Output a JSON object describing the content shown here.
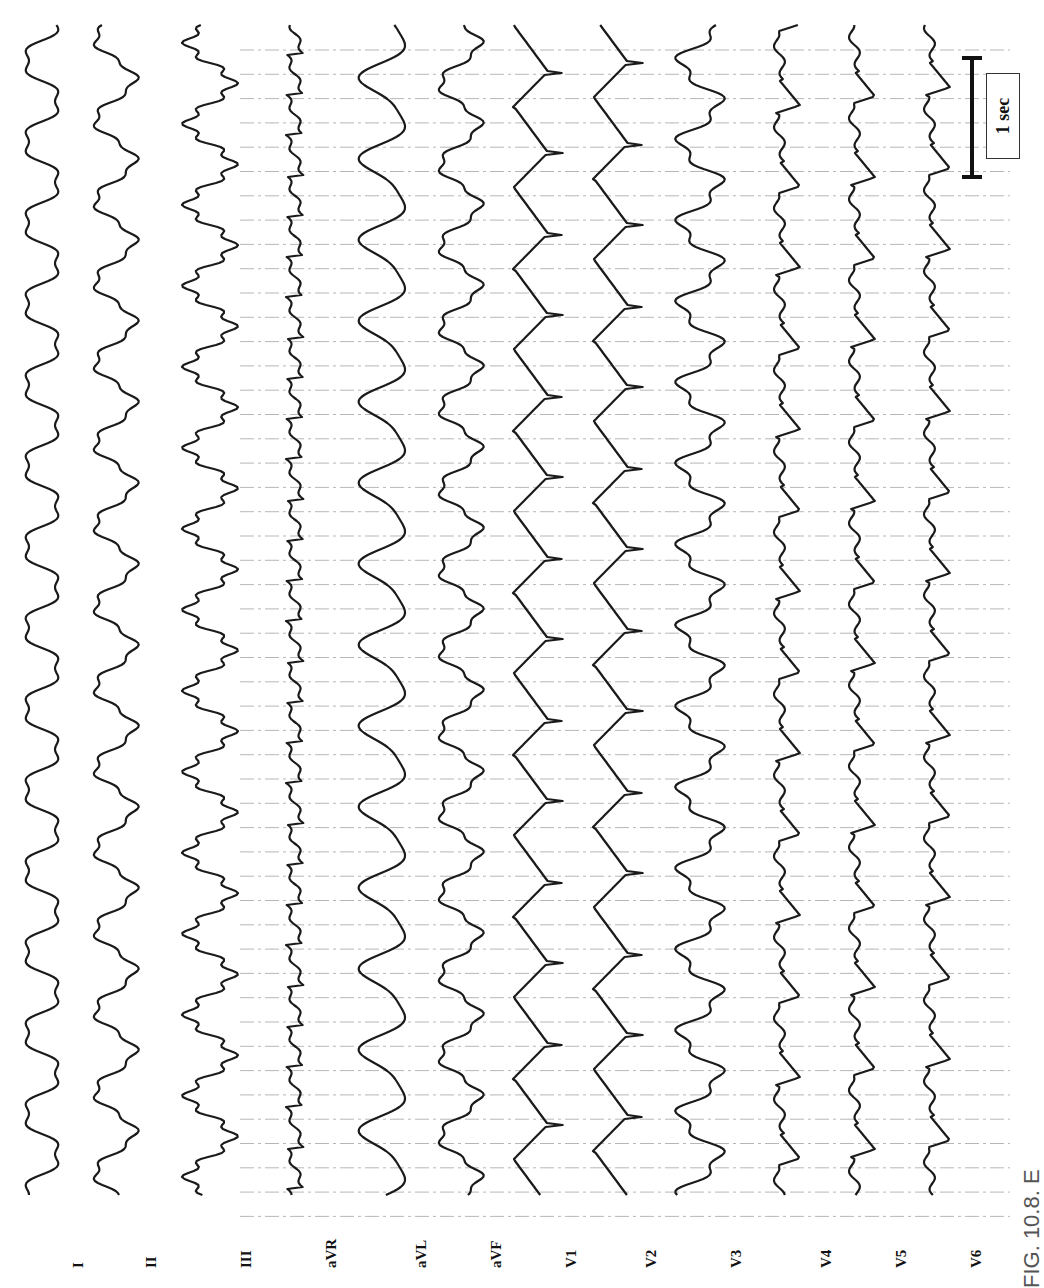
{
  "figure": {
    "caption": "FIG. 10.8. E",
    "orientation": "rotated 90° counter-clockwise",
    "scale_bar": {
      "label": "1 sec"
    }
  },
  "leads": [
    {
      "label": "I",
      "x": 42,
      "type": "sine"
    },
    {
      "label": "II",
      "x": 115,
      "type": "sine2"
    },
    {
      "label": "III",
      "x": 210,
      "type": "notched"
    },
    {
      "label": "aVR",
      "x": 295,
      "type": "slant"
    },
    {
      "label": "aVL",
      "x": 385,
      "type": "sine3"
    },
    {
      "label": "aVF",
      "x": 460,
      "type": "sine2"
    },
    {
      "label": "V1",
      "x": 535,
      "type": "square"
    },
    {
      "label": "V2",
      "x": 615,
      "type": "square"
    },
    {
      "label": "V3",
      "x": 700,
      "type": "notched2"
    },
    {
      "label": "V4",
      "x": 790,
      "type": "spiky"
    },
    {
      "label": "V5",
      "x": 865,
      "type": "spiky"
    },
    {
      "label": "V6",
      "x": 940,
      "type": "spiky"
    }
  ],
  "colors": {
    "trace": "#1a1a1a",
    "grid": "#9a9a9a",
    "background": "#ffffff"
  }
}
